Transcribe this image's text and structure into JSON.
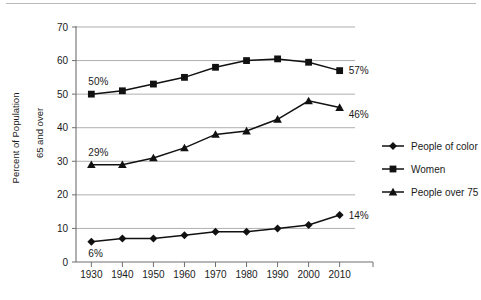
{
  "chart_data": {
    "type": "line",
    "title": "",
    "xlabel": "",
    "ylabel": "Percent of Population 65 and over",
    "ylabel_line1": "Percent of Population",
    "ylabel_line2": "65 and over",
    "categories": [
      "1930",
      "1940",
      "1950",
      "1960",
      "1970",
      "1980",
      "1990",
      "2000",
      "2010"
    ],
    "x": [
      1930,
      1940,
      1950,
      1960,
      1970,
      1980,
      1990,
      2000,
      2010
    ],
    "xlim": [
      1925,
      2015
    ],
    "ylim": [
      0,
      70
    ],
    "yticks": [
      0,
      10,
      20,
      30,
      40,
      50,
      60,
      70
    ],
    "ytick_labels": [
      "0",
      "10",
      "20",
      "30",
      "40",
      "50",
      "60",
      "70"
    ],
    "grid": true,
    "grid_axis": "y",
    "legend_position": "right",
    "series": [
      {
        "name": "People of color",
        "marker": "diamond",
        "values": [
          6,
          7,
          7,
          8,
          9,
          9,
          10,
          11,
          14
        ],
        "start_label": "6%",
        "end_label": "14%"
      },
      {
        "name": "Women",
        "marker": "square",
        "values": [
          50,
          51,
          53,
          55,
          58,
          60,
          60.5,
          59.5,
          57
        ],
        "start_label": "50%",
        "end_label": "57%"
      },
      {
        "name": "People over 75",
        "marker": "triangle",
        "values": [
          29,
          29,
          31,
          34,
          38,
          39,
          42.5,
          48,
          46
        ],
        "start_label": "29%",
        "end_label": "46%"
      }
    ],
    "annotations": [
      {
        "text": "50%",
        "series": "Women",
        "at": "1930"
      },
      {
        "text": "57%",
        "series": "Women",
        "at": "2010"
      },
      {
        "text": "29%",
        "series": "People over 75",
        "at": "1930"
      },
      {
        "text": "46%",
        "series": "People over 75",
        "at": "2010"
      },
      {
        "text": "6%",
        "series": "People of color",
        "at": "1930"
      },
      {
        "text": "14%",
        "series": "People of color",
        "at": "2010"
      }
    ],
    "colors": {
      "line": "#111111",
      "marker": "#111111",
      "grid": "#9a9a9a",
      "axis": "#6f6f6f",
      "background": "#ffffff"
    }
  },
  "legend": {
    "items": [
      {
        "label": "People of color",
        "marker": "diamond"
      },
      {
        "label": "Women",
        "marker": "square"
      },
      {
        "label": "People over 75",
        "marker": "triangle"
      }
    ]
  },
  "axes": {
    "y_ticks": [
      "70",
      "60",
      "50",
      "40",
      "30",
      "20",
      "10",
      "0"
    ],
    "x_ticks": [
      "1930",
      "1940",
      "1950",
      "1960",
      "1970",
      "1980",
      "1990",
      "2000",
      "2010"
    ]
  }
}
